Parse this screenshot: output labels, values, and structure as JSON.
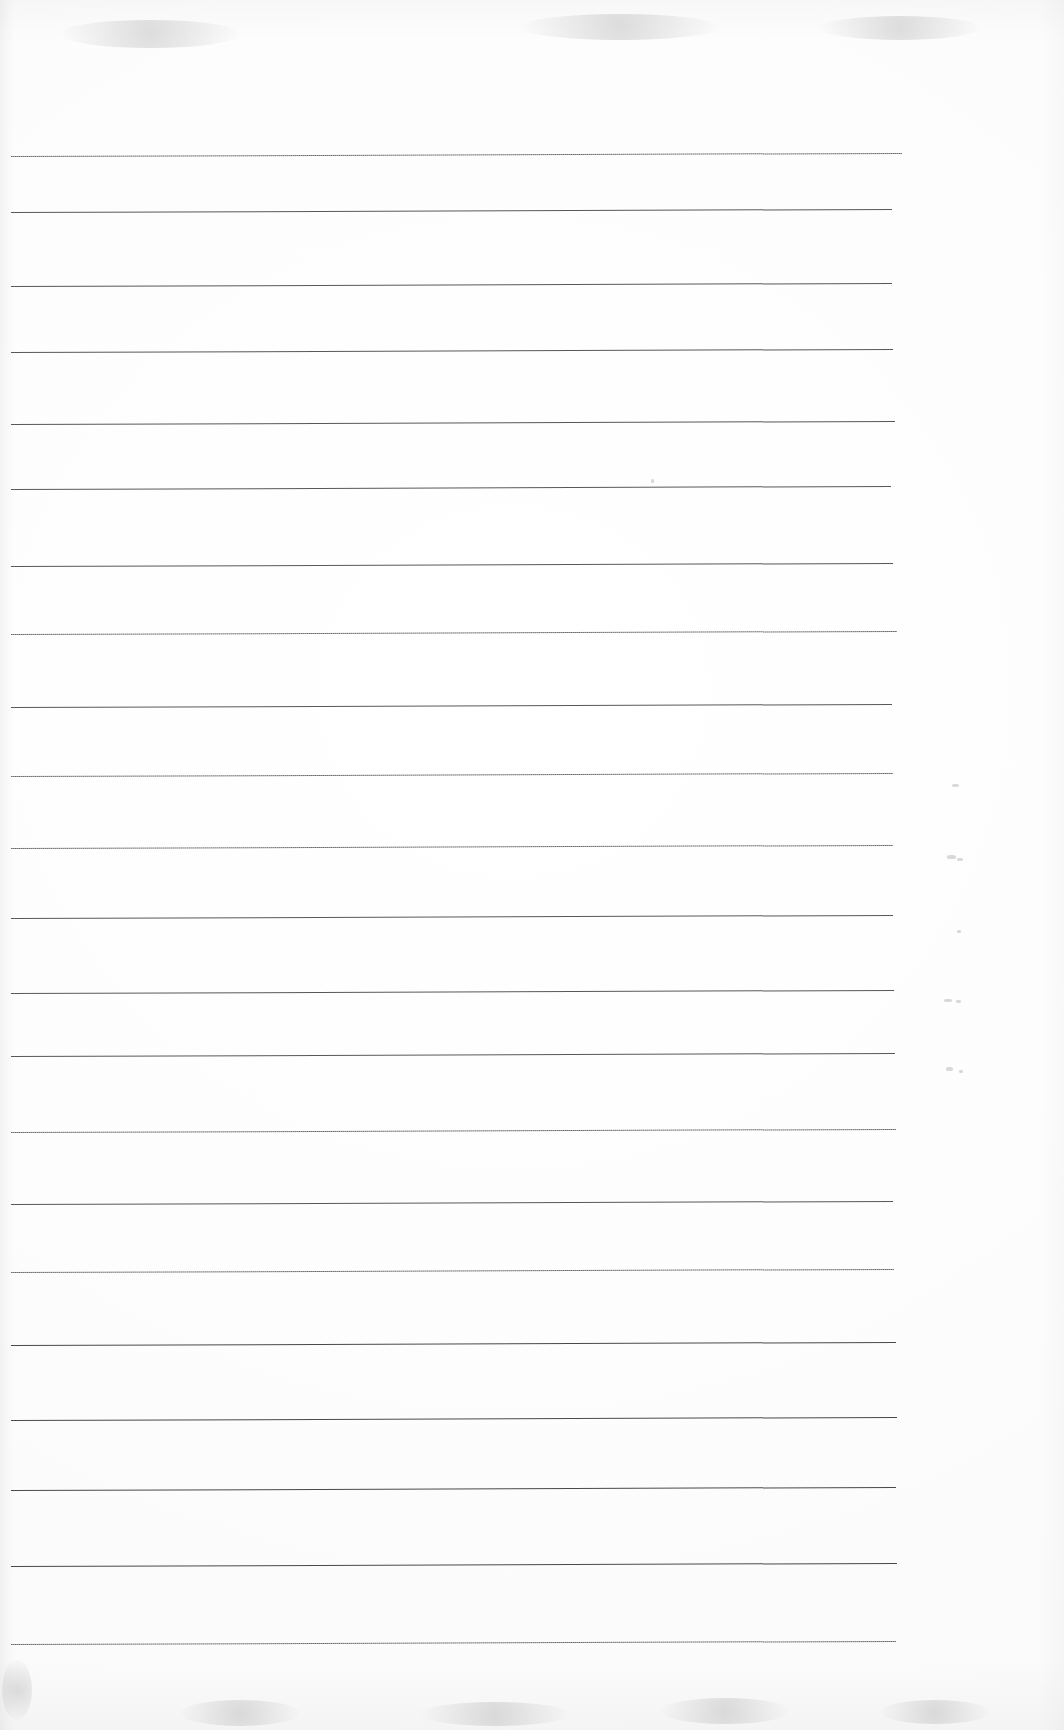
{
  "document": {
    "kind": "scanned-ruled-paper",
    "title": "Blank ruled notebook page (scan)",
    "page_width": 1064,
    "page_height": 1730,
    "background_color": "#ffffff",
    "paper_tint": "#fdfdfd",
    "has_text_content": false,
    "visible_text": "",
    "notes": "No handwriting, no printed text, no headings or page numbers are visible on this scan."
  },
  "ruling": {
    "style": "horizontal-ruled",
    "line_color": "#4a4a4a",
    "line_count": 20,
    "line_thickness_px": 1,
    "line_spacing_px": 78.4,
    "left_margin_px": 11,
    "right_end_px": 903,
    "skew_degrees": -0.2,
    "first_line_y_px": 156,
    "last_line_y_px": 1646,
    "lines": [
      {
        "index": 1,
        "y": 156,
        "x_start": 11,
        "x_end": 902,
        "weight": "soft"
      },
      {
        "index": 2,
        "y": 212,
        "x_start": 11,
        "x_end": 892,
        "weight": "normal"
      },
      {
        "index": 3,
        "y": 286,
        "x_start": 11,
        "x_end": 892,
        "weight": "normal"
      },
      {
        "index": 4,
        "y": 352,
        "x_start": 11,
        "x_end": 893,
        "weight": "normal"
      },
      {
        "index": 5,
        "y": 424,
        "x_start": 11,
        "x_end": 895,
        "weight": "normal"
      },
      {
        "index": 6,
        "y": 489,
        "x_start": 11,
        "x_end": 891,
        "weight": "normal"
      },
      {
        "index": 7,
        "y": 566,
        "x_start": 11,
        "x_end": 893,
        "weight": "normal"
      },
      {
        "index": 8,
        "y": 634,
        "x_start": 11,
        "x_end": 897,
        "weight": "soft"
      },
      {
        "index": 9,
        "y": 707,
        "x_start": 11,
        "x_end": 892,
        "weight": "normal"
      },
      {
        "index": 10,
        "y": 776,
        "x_start": 11,
        "x_end": 893,
        "weight": "soft"
      },
      {
        "index": 11,
        "y": 848,
        "x_start": 11,
        "x_end": 893,
        "weight": "soft"
      },
      {
        "index": 12,
        "y": 918,
        "x_start": 11,
        "x_end": 893,
        "weight": "normal"
      },
      {
        "index": 13,
        "y": 993,
        "x_start": 11,
        "x_end": 894,
        "weight": "normal"
      },
      {
        "index": 14,
        "y": 1056,
        "x_start": 11,
        "x_end": 895,
        "weight": "normal"
      },
      {
        "index": 15,
        "y": 1132,
        "x_start": 11,
        "x_end": 896,
        "weight": "soft"
      },
      {
        "index": 16,
        "y": 1204,
        "x_start": 11,
        "x_end": 893,
        "weight": "normal"
      },
      {
        "index": 17,
        "y": 1272,
        "x_start": 11,
        "x_end": 894,
        "weight": "soft"
      },
      {
        "index": 18,
        "y": 1345,
        "x_start": 11,
        "x_end": 896,
        "weight": "dark"
      },
      {
        "index": 19,
        "y": 1420,
        "x_start": 11,
        "x_end": 897,
        "weight": "dark"
      },
      {
        "index": 20,
        "y": 1490,
        "x_start": 11,
        "x_end": 896,
        "weight": "dark"
      },
      {
        "index": 21,
        "y": 1566,
        "x_start": 11,
        "x_end": 897,
        "weight": "dark"
      },
      {
        "index": 22,
        "y": 1644,
        "x_start": 11,
        "x_end": 896,
        "weight": "soft"
      }
    ]
  },
  "artifacts": {
    "description": "Faint grey scanner specks and smudges outside the ruled area",
    "specks": [
      {
        "x": 952,
        "y": 784,
        "w": 7,
        "h": 3
      },
      {
        "x": 947,
        "y": 855,
        "w": 9,
        "h": 4
      },
      {
        "x": 957,
        "y": 858,
        "w": 6,
        "h": 3
      },
      {
        "x": 957,
        "y": 930,
        "w": 4,
        "h": 3
      },
      {
        "x": 944,
        "y": 999,
        "w": 8,
        "h": 3
      },
      {
        "x": 956,
        "y": 1000,
        "w": 5,
        "h": 3
      },
      {
        "x": 946,
        "y": 1067,
        "w": 7,
        "h": 4
      },
      {
        "x": 959,
        "y": 1070,
        "w": 4,
        "h": 3
      },
      {
        "x": 651,
        "y": 479,
        "w": 3,
        "h": 4
      }
    ],
    "smudges": [
      {
        "x": 180,
        "y": 1700,
        "w": 120,
        "h": 26
      },
      {
        "x": 420,
        "y": 1702,
        "w": 150,
        "h": 24
      },
      {
        "x": 660,
        "y": 1698,
        "w": 130,
        "h": 26
      },
      {
        "x": 880,
        "y": 1700,
        "w": 110,
        "h": 24
      },
      {
        "x": 60,
        "y": 20,
        "w": 180,
        "h": 28
      },
      {
        "x": 520,
        "y": 14,
        "w": 200,
        "h": 26
      },
      {
        "x": 820,
        "y": 16,
        "w": 160,
        "h": 24
      },
      {
        "x": 2,
        "y": 1660,
        "w": 30,
        "h": 60
      }
    ]
  }
}
